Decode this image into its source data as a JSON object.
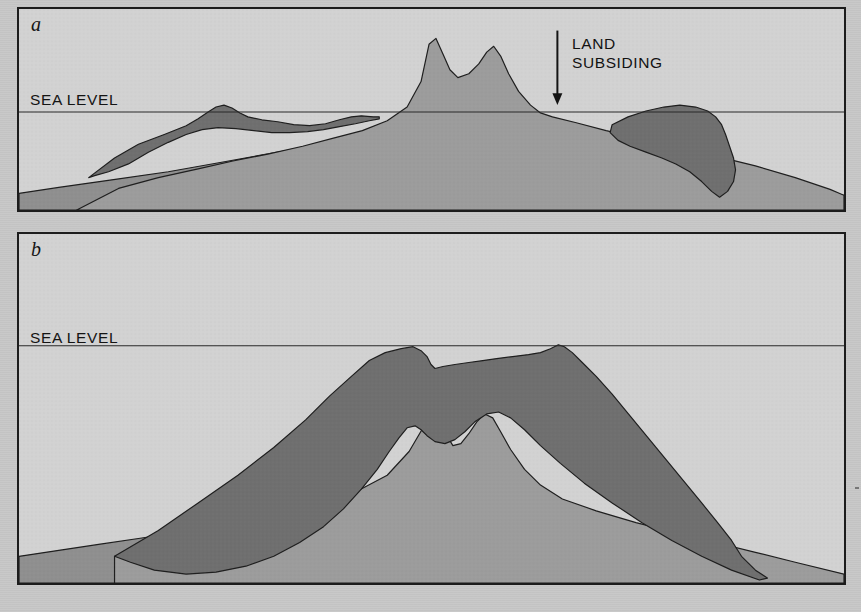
{
  "figure": {
    "domain": "Diagram",
    "kind": "geological cross-section",
    "background_color": "#c7c7c7",
    "panel_background_color": "#d2d2d2",
    "frame_color": "#1c1c1c",
    "reef_color": "#6f6f6f",
    "volcano_color": "#9c9c9c",
    "seafloor_color": "#8f8f8f",
    "ink_color": "#141414"
  },
  "panels": [
    {
      "id": "a",
      "label": "a",
      "sea_level_label": "SEA LEVEL",
      "sea_level_y": 105,
      "annotation": {
        "line1": "LAND",
        "line2": "SUBSIDING",
        "arrow": "down-arrow-icon",
        "arrow_x": 541,
        "arrow_top": 22,
        "arrow_bottom": 98
      }
    },
    {
      "id": "b",
      "label": "b",
      "sea_level_label": "SEA LEVEL",
      "sea_level_y": 113,
      "annotation": null
    }
  ],
  "chart_data": {
    "type": "area",
    "series": [
      {
        "name": "panel-a-seafloor",
        "panel": "a",
        "layer": "seafloor",
        "points": "0,205 0,188 40,182 95,174 150,166 205,156 260,146 330,135 400,128 470,132 540,140 600,150 660,160 720,170 780,180 829,190 829,205"
      },
      {
        "name": "panel-a-volcano",
        "panel": "a",
        "layer": "volcanic-edifice",
        "points": "58,205 100,183 140,172 180,163 215,155 250,148 285,140 315,132 345,124 370,114 390,100 404,74 412,36 419,30 426,46 433,62 441,70 452,66 462,56 470,44 477,38 484,48 492,66 502,84 514,98 524,106 536,110 560,116 590,124 625,132 660,140 700,150 740,160 780,172 815,184 829,190 829,205"
      },
      {
        "name": "panel-a-reef",
        "panel": "a",
        "layer": "coral-reef",
        "points": "70,172 96,152 120,138 146,128 168,119 180,112 190,105 198,100 206,98 214,101 222,106 230,110 244,113 260,115 276,118 292,119 308,117 322,113 334,110 344,109 356,110 362,110 362,112 352,114 338,117 322,120 306,123 290,125 272,126 254,126 236,124 218,122 200,121 184,123 168,128 150,136 130,146 110,158 90,166 76,170"
      },
      {
        "name": "panel-a-reef-right",
        "panel": "a",
        "layer": "coral-reef",
        "points": "596,118 612,110 630,104 648,100 664,98 680,100 692,104 700,110 706,118 710,128 714,140 718,152 720,164 718,176 712,186 704,192 696,186 686,176 674,166 660,158 646,152 630,146 614,140 602,134 594,126"
      },
      {
        "name": "panel-b-seafloor",
        "panel": "b",
        "layer": "seafloor",
        "points": "0,353 0,326 40,320 80,314 120,308 160,302 200,298 240,296 300,296 360,300 420,306 480,314 540,322 600,328 660,334 720,340 780,344 829,348 829,353"
      },
      {
        "name": "panel-b-volcano",
        "panel": "b",
        "layer": "volcanic-edifice",
        "points": "96,326 150,312 200,300 250,288 300,274 340,260 370,244 392,220 406,196 416,186 424,192 430,204 436,214 444,212 452,202 460,190 468,182 476,186 484,200 494,218 508,238 524,254 546,268 580,280 620,292 660,302 700,312 740,322 780,332 829,344 829,353 96,353"
      },
      {
        "name": "panel-b-reef",
        "panel": "b",
        "layer": "coral-reef-atoll",
        "points": "96,326 140,300 180,272 220,244 256,216 288,188 312,164 334,144 352,128 368,120 384,116 396,114 404,118 410,124 414,132 418,136 426,134 438,132 452,130 466,128 480,126 496,124 512,122 524,120 534,116 542,112 548,114 556,120 566,130 580,144 596,162 614,184 632,206 650,228 668,250 686,272 702,292 716,310 726,326 740,340 752,348 744,350 716,340 686,326 656,310 626,292 596,272 568,252 544,232 524,214 508,198 494,186 482,180 470,182 458,190 448,200 438,208 428,212 418,210 410,204 404,198 398,194 390,196 382,206 372,220 360,238 344,258 326,278 306,296 282,312 256,326 228,336 198,342 168,344 136,340 112,332"
      }
    ],
    "annotations": [
      {
        "panel": "a",
        "text": "SEA LEVEL",
        "type": "axis-label"
      },
      {
        "panel": "a",
        "text": "LAND SUBSIDING",
        "type": "arrow-annotation",
        "direction": "down"
      },
      {
        "panel": "b",
        "text": "SEA LEVEL",
        "type": "axis-label"
      }
    ]
  },
  "ghost_text": [
    {
      "text": "is subject to the slow but steady erosion of",
      "x": 60,
      "y": 258
    },
    {
      "text": "sand and rubble that accumulate along its",
      "x": 60,
      "y": 282
    },
    {
      "text": "the reef flat",
      "x": 60,
      "y": 306
    },
    {
      "text": "While the",
      "x": 46,
      "y": 386
    },
    {
      "text": "corals grow",
      "x": 46,
      "y": 410
    },
    {
      "text": "upward, the",
      "x": 46,
      "y": 434
    },
    {
      "text": "island sinks",
      "x": 46,
      "y": 458
    },
    {
      "text": "below the sea",
      "x": 46,
      "y": 482
    },
    {
      "text": "surface",
      "x": 46,
      "y": 506
    },
    {
      "text": "windward side of an island",
      "x": 470,
      "y": 258
    },
    {
      "text": "lagoon deepens as",
      "x": 470,
      "y": 282
    },
    {
      "text": "reefs keep",
      "x": 616,
      "y": 370
    },
    {
      "text": "pace with",
      "x": 616,
      "y": 394
    },
    {
      "text": "the rising",
      "x": 616,
      "y": 418
    },
    {
      "text": "sea level",
      "x": 616,
      "y": 442
    }
  ]
}
